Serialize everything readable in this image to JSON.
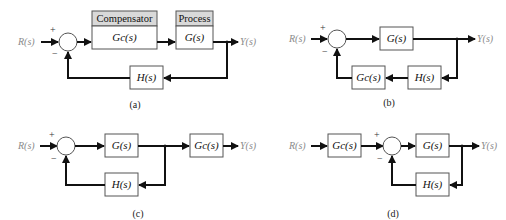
{
  "diagrams": {
    "a": {
      "caption": "(a)",
      "input": "R(s)",
      "output": "Y(s)",
      "plus_sign": "+",
      "minus_sign": "−",
      "compensator_header": "Compensator",
      "compensator_tf": "Gc(s)",
      "process_header": "Process",
      "process_tf": "G(s)",
      "feedback_tf": "H(s)"
    },
    "b": {
      "caption": "(b)",
      "input": "R(s)",
      "output": "Y(s)",
      "plus_sign": "+",
      "minus_sign": "−",
      "forward_tf": "G(s)",
      "feedback_compensator_tf": "Gc(s)",
      "feedback_tf": "H(s)"
    },
    "c": {
      "caption": "(c)",
      "input": "R(s)",
      "output": "Y(s)",
      "plus_sign": "+",
      "minus_sign": "−",
      "forward_tf": "G(s)",
      "output_compensator_tf": "Gc(s)",
      "feedback_tf": "H(s)"
    },
    "d": {
      "caption": "(d)",
      "input": "R(s)",
      "output": "Y(s)",
      "plus_sign": "+",
      "minus_sign": "−",
      "input_compensator_tf": "Gc(s)",
      "forward_tf": "G(s)",
      "feedback_tf": "H(s)"
    }
  },
  "colors": {
    "wire": "#111111",
    "block_border": "#555555",
    "header_fill": "#d9d9d9",
    "signal_label": "#8a8a8a"
  }
}
